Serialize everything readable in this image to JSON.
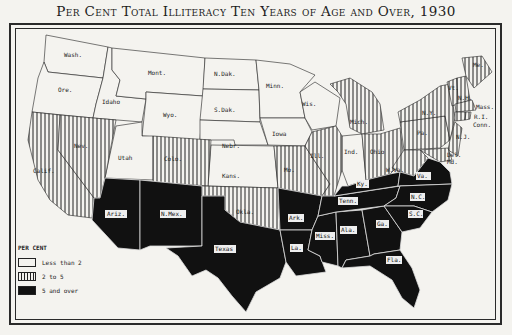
{
  "title": "Per Cent Total Illiteracy Ten Years of Age and Over, 1930",
  "legend": {
    "heading": "PER CENT",
    "items": [
      {
        "key": "low",
        "label": "Less than 2",
        "pattern": "white"
      },
      {
        "key": "mid",
        "label": "2 to 5",
        "pattern": "vertical-hatch"
      },
      {
        "key": "high",
        "label": "5 and over",
        "pattern": "black"
      }
    ]
  },
  "colors": {
    "paper": "#f4f3ef",
    "ink": "#111111"
  },
  "states": [
    {
      "abbr": "Wash.",
      "category": "low"
    },
    {
      "abbr": "Ore.",
      "category": "low"
    },
    {
      "abbr": "Idaho",
      "category": "low"
    },
    {
      "abbr": "Mont.",
      "category": "low"
    },
    {
      "abbr": "Wyo.",
      "category": "low"
    },
    {
      "abbr": "N.Dak.",
      "category": "low"
    },
    {
      "abbr": "S.Dak.",
      "category": "low"
    },
    {
      "abbr": "Nebr.",
      "category": "low"
    },
    {
      "abbr": "Kans.",
      "category": "low"
    },
    {
      "abbr": "Minn.",
      "category": "low"
    },
    {
      "abbr": "Iowa",
      "category": "low"
    },
    {
      "abbr": "Wis.",
      "category": "low"
    },
    {
      "abbr": "Utah",
      "category": "low"
    },
    {
      "abbr": "Ind.",
      "category": "low"
    },
    {
      "abbr": "Calif.",
      "category": "mid"
    },
    {
      "abbr": "Nev.",
      "category": "mid"
    },
    {
      "abbr": "Colo.",
      "category": "mid"
    },
    {
      "abbr": "Okla.",
      "category": "mid"
    },
    {
      "abbr": "Mo.",
      "category": "mid"
    },
    {
      "abbr": "Ill.",
      "category": "mid"
    },
    {
      "abbr": "Mich.",
      "category": "mid"
    },
    {
      "abbr": "Ohio",
      "category": "mid"
    },
    {
      "abbr": "Pa.",
      "category": "mid"
    },
    {
      "abbr": "N.Y.",
      "category": "mid"
    },
    {
      "abbr": "Vt.",
      "category": "mid"
    },
    {
      "abbr": "N.H.",
      "category": "mid"
    },
    {
      "abbr": "Me.",
      "category": "mid"
    },
    {
      "abbr": "Mass.",
      "category": "mid"
    },
    {
      "abbr": "R.I.",
      "category": "mid"
    },
    {
      "abbr": "Conn.",
      "category": "mid"
    },
    {
      "abbr": "N.J.",
      "category": "mid"
    },
    {
      "abbr": "Del.",
      "category": "mid"
    },
    {
      "abbr": "Md.",
      "category": "mid"
    },
    {
      "abbr": "W.Va.",
      "category": "mid"
    },
    {
      "abbr": "Ariz.",
      "category": "high"
    },
    {
      "abbr": "N.Mex.",
      "category": "high"
    },
    {
      "abbr": "Texas",
      "category": "high"
    },
    {
      "abbr": "Ark.",
      "category": "high"
    },
    {
      "abbr": "La.",
      "category": "high"
    },
    {
      "abbr": "Miss.",
      "category": "high"
    },
    {
      "abbr": "Ala.",
      "category": "high"
    },
    {
      "abbr": "Ga.",
      "category": "high"
    },
    {
      "abbr": "Fla.",
      "category": "high"
    },
    {
      "abbr": "Tenn.",
      "category": "high"
    },
    {
      "abbr": "Ky.",
      "category": "high"
    },
    {
      "abbr": "Va.",
      "category": "high"
    },
    {
      "abbr": "N.C.",
      "category": "high"
    },
    {
      "abbr": "S.C.",
      "category": "high"
    }
  ],
  "labels": {
    "wash": "Wash.",
    "ore": "Ore.",
    "idaho": "Idaho",
    "mont": "Mont.",
    "wyo": "Wyo.",
    "ndak": "N.Dak.",
    "sdak": "S.Dak.",
    "nebr": "Nebr.",
    "kans": "Kans.",
    "minn": "Minn.",
    "iowa": "Iowa",
    "wis": "Wis.",
    "utah": "Utah",
    "ind": "Ind.",
    "calif": "Calif.",
    "nev": "Nev.",
    "colo": "Colo.",
    "okla": "Okla.",
    "mo": "Mo.",
    "ill": "Ill.",
    "mich": "Mich.",
    "ohio": "Ohio",
    "pa": "Pa.",
    "ny": "N.Y.",
    "vt": "Vt.",
    "nh": "N.H.",
    "me": "Me.",
    "mass": "Mass.",
    "ri": "R.I.",
    "conn": "Conn.",
    "nj": "N.J.",
    "del": "Del.",
    "md": "Md.",
    "wva": "W.Va.",
    "ariz": "Ariz.",
    "nmex": "N.Mex.",
    "texas": "Texas",
    "ark": "Ark.",
    "la": "La.",
    "miss": "Miss.",
    "ala": "Ala.",
    "ga": "Ga.",
    "fla": "Fla.",
    "tenn": "Tenn.",
    "ky": "Ky.",
    "va": "Va.",
    "nc": "N.C.",
    "sc": "S.C."
  }
}
